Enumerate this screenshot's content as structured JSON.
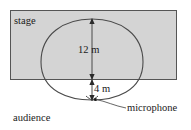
{
  "figure": {
    "background_color": "#ffffff",
    "stage": {
      "label": "stage",
      "fill_color": "#d4d4d4",
      "stroke_color": "#555555"
    },
    "audience": {
      "label": "audience"
    },
    "curve": {
      "name": "cardioid",
      "stroke_color": "#4a4a4a"
    },
    "dimensions": [
      {
        "id": "height",
        "label": "12 m",
        "value": 12,
        "unit": "m"
      },
      {
        "id": "offset",
        "label": "4 m",
        "value": 4,
        "unit": "m"
      }
    ],
    "microphone": {
      "label": "microphone"
    }
  }
}
